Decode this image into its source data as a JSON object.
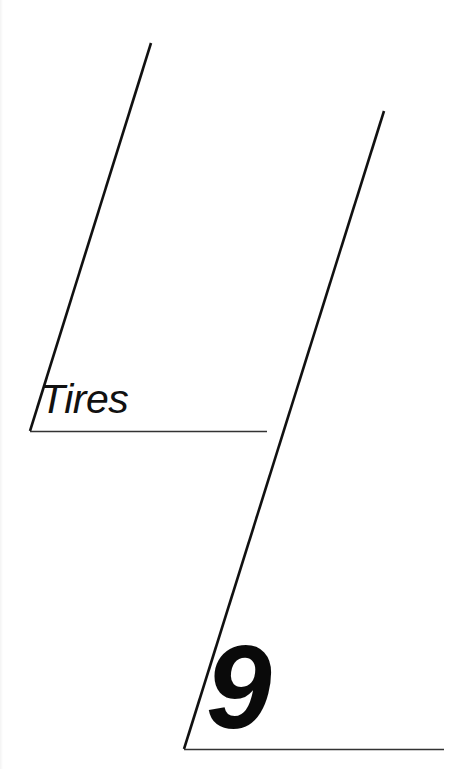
{
  "page": {
    "type": "chapter-divider",
    "background_color": "#ffffff",
    "ink_color": "#111111"
  },
  "section": {
    "title": "Tires"
  },
  "chapter": {
    "number": "9"
  },
  "decorations": {
    "upper_rule": {
      "slant_start": [
        151,
        43
      ],
      "slant_end": [
        30,
        431
      ],
      "base_start": [
        30,
        431
      ],
      "base_end": [
        267,
        431
      ]
    },
    "lower_rule": {
      "slant_start": [
        384,
        111
      ],
      "slant_end": [
        184,
        749
      ],
      "base_start": [
        184,
        749
      ],
      "base_end": [
        444,
        749
      ]
    }
  }
}
